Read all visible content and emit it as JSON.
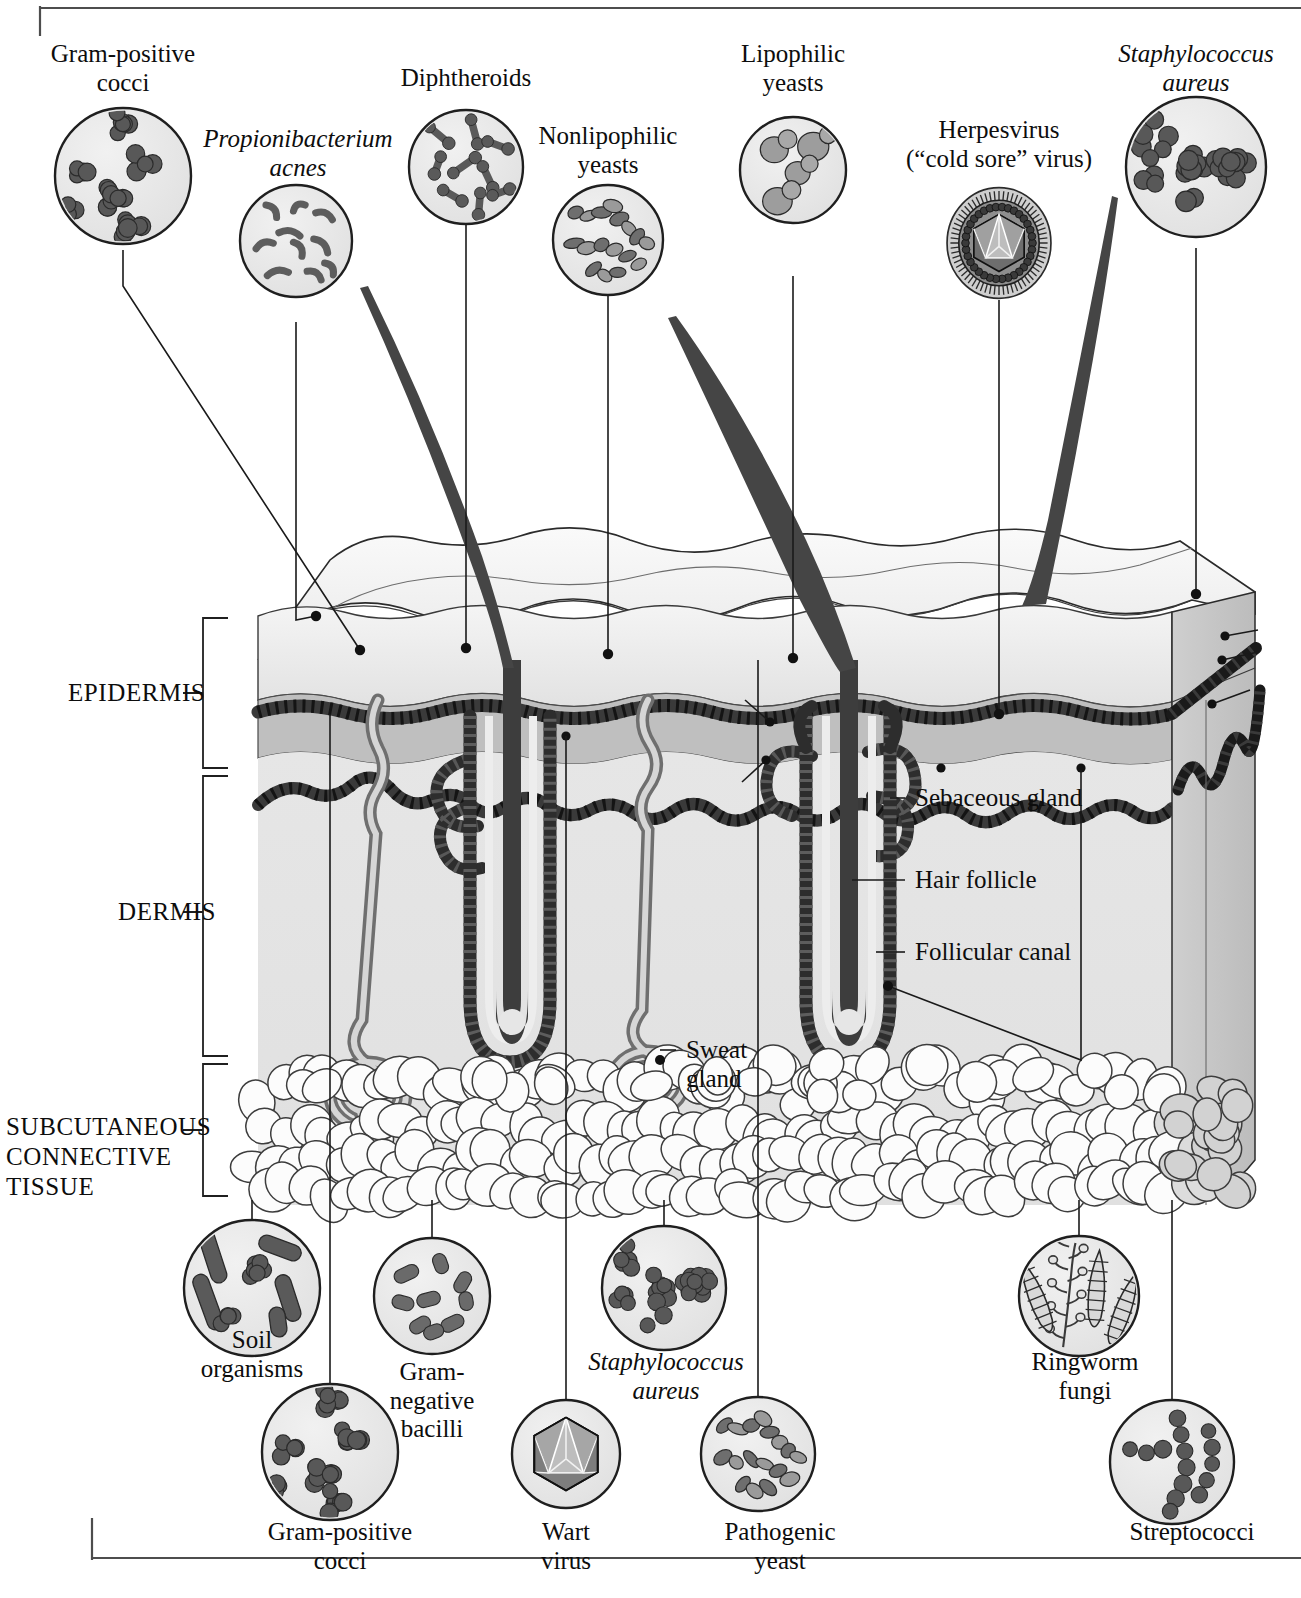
{
  "figure": {
    "title": ""
  },
  "layer_labels": [
    {
      "id": "epidermis",
      "text": "EPIDERMIS"
    },
    {
      "id": "dermis",
      "text": "DERMIS"
    },
    {
      "id": "subcutaneous",
      "text": "SUBCUTANEOUS\nCONNECTIVE\nTISSUE"
    }
  ],
  "structure_labels": [
    {
      "id": "sebaceous-gland",
      "text": "Sebaceous gland"
    },
    {
      "id": "hair-follicle",
      "text": "Hair follicle"
    },
    {
      "id": "follicular-canal",
      "text": "Follicular canal"
    },
    {
      "id": "sweat-gland",
      "text": "Sweat\ngland"
    }
  ],
  "top_organisms": [
    {
      "id": "gram-positive-cocci-top",
      "text": "Gram-positive\ncocci",
      "italic": false,
      "inset": "cocci-clusters"
    },
    {
      "id": "propionibacterium-acnes",
      "text": "Propionibacterium\nacnes",
      "italic": true,
      "inset": "curved-rods"
    },
    {
      "id": "diphtheroids",
      "text": "Diphtheroids",
      "italic": false,
      "inset": "club-rods"
    },
    {
      "id": "nonlipophilic-yeasts",
      "text": "Nonlipophilic\nyeasts",
      "italic": false,
      "inset": "pseudohyphae"
    },
    {
      "id": "lipophilic-yeasts",
      "text": "Lipophilic\nyeasts",
      "italic": false,
      "inset": "budding-yeast"
    },
    {
      "id": "herpesvirus",
      "text": "Herpesvirus\n(“cold sore” virus)",
      "italic": false,
      "inset": "enveloped-virus"
    },
    {
      "id": "staphylococcus-aureus-top",
      "text": "Staphylococcus\naureus",
      "italic": true,
      "inset": "staph-clusters"
    }
  ],
  "bottom_organisms": [
    {
      "id": "soil-organisms",
      "text": "Soil\norganisms",
      "italic": false,
      "inset": "mixed-soil"
    },
    {
      "id": "gram-positive-cocci-bottom",
      "text": "Gram-positive\ncocci",
      "italic": false,
      "inset": "cocci-clusters"
    },
    {
      "id": "gram-negative-bacilli",
      "text": "Gram-\nnegative\nbacilli",
      "italic": false,
      "inset": "plump-rods"
    },
    {
      "id": "wart-virus",
      "text": "Wart\nvirus",
      "italic": false,
      "inset": "naked-icosahedron"
    },
    {
      "id": "staphylococcus-aureus-bottom",
      "text": "Staphylococcus\naureus",
      "italic": true,
      "inset": "staph-clusters"
    },
    {
      "id": "pathogenic-yeast",
      "text": "Pathogenic\nyeast",
      "italic": false,
      "inset": "pseudohyphae"
    },
    {
      "id": "ringworm-fungi",
      "text": "Ringworm\nfungi",
      "italic": false,
      "inset": "macroconidia"
    },
    {
      "id": "streptococci",
      "text": "Streptococci",
      "italic": false,
      "inset": "cocci-chains"
    }
  ],
  "colors": {
    "ink": "#0d0d0d",
    "line": "#1a1a1a",
    "stratum_corneum": "#ebebeb",
    "granular_band": "#bdbdbd",
    "dermis": "#e3e3e3",
    "side_face": "#c6c6c6",
    "basal_line": "#4a4a4a",
    "hair": "#4d4d4d",
    "organism_fill": "#5f5f5f",
    "circle_fill": "#e8e8e8",
    "fat_cell": "#fbfbfb"
  }
}
